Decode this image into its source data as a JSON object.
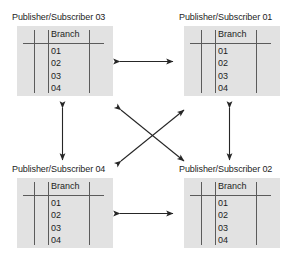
{
  "diagram": {
    "type": "replication-topology",
    "table_header": "Branch",
    "nodes": [
      {
        "id": "ps03",
        "title": "Publisher/Subscriber 03",
        "position": "top-left",
        "table": {
          "columns": [
            "",
            "Branch"
          ],
          "rows": [
            "01",
            "02",
            "03",
            "04"
          ]
        }
      },
      {
        "id": "ps01",
        "title": "Publisher/Subscriber 01",
        "position": "top-right",
        "table": {
          "columns": [
            "",
            "Branch"
          ],
          "rows": [
            "01",
            "02",
            "03",
            "04"
          ]
        }
      },
      {
        "id": "ps04",
        "title": "Publisher/Subscriber 04",
        "position": "bottom-left",
        "table": {
          "columns": [
            "",
            "Branch"
          ],
          "rows": [
            "01",
            "02",
            "03",
            "04"
          ]
        }
      },
      {
        "id": "ps02",
        "title": "Publisher/Subscriber 02",
        "position": "bottom-right",
        "table": {
          "columns": [
            "",
            "Branch"
          ],
          "rows": [
            "01",
            "02",
            "03",
            "04"
          ]
        }
      }
    ],
    "connections": [
      {
        "id": "top-horizontal",
        "from": "ps03",
        "to": "ps01",
        "style": "double-arrow",
        "orientation": "horizontal"
      },
      {
        "id": "bottom-horizontal",
        "from": "ps04",
        "to": "ps02",
        "style": "double-arrow",
        "orientation": "horizontal"
      },
      {
        "id": "left-vertical",
        "from": "ps03",
        "to": "ps04",
        "style": "double-arrow",
        "orientation": "vertical"
      },
      {
        "id": "right-vertical",
        "from": "ps01",
        "to": "ps02",
        "style": "double-arrow",
        "orientation": "vertical"
      },
      {
        "id": "diagonal-nw-se",
        "from": "ps03",
        "to": "ps02",
        "style": "double-arrow",
        "orientation": "diagonal"
      },
      {
        "id": "diagonal-sw-ne",
        "from": "ps04",
        "to": "ps01",
        "style": "double-arrow",
        "orientation": "diagonal"
      }
    ],
    "colors": {
      "panel_fill": "#e2e2e2",
      "rule": "#5b5b5b",
      "text": "#1d1d1d",
      "arrow": "#262626",
      "background": "#ffffff"
    }
  }
}
